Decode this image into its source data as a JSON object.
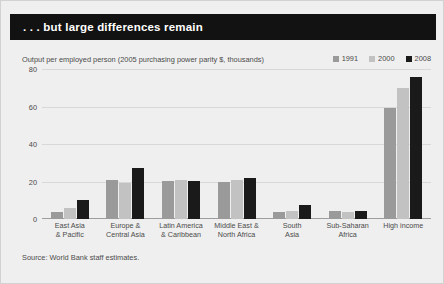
{
  "header": {
    "title": ". . . but large differences remain"
  },
  "subtitle": "Output per employed person (2005 purchasing power parity $, thousands)",
  "source": "Source: World Bank staff estimates.",
  "colors": {
    "series_1991": "#9a9a9a",
    "series_2000": "#c2c2c2",
    "series_2008": "#1a1a1a",
    "background": "#efefef",
    "header_band": "#121212",
    "gridline": "#d8d8d8",
    "axis": "#9d9d9d",
    "text": "#4b4b4b"
  },
  "chart_data": {
    "type": "bar",
    "title": ". . . but large differences remain",
    "subtitle": "Output per employed person (2005 purchasing power parity $, thousands)",
    "xlabel": "",
    "ylabel": "",
    "ylim": [
      0,
      80
    ],
    "yticks": [
      0,
      20,
      40,
      60,
      80
    ],
    "grid": true,
    "legend_position": "top-right",
    "categories": [
      "East Asia\n& Pacific",
      "Europe &\nCentral Asia",
      "Latin America\n& Caribbean",
      "Middle East &\nNorth Africa",
      "South\nAsia",
      "Sub-Saharan\nAfrica",
      "High income"
    ],
    "category_lines": [
      [
        "East Asia",
        "& Pacific"
      ],
      [
        "Europe &",
        "Central Asia"
      ],
      [
        "Latin America",
        "& Caribbean"
      ],
      [
        "Middle East &",
        "North Africa"
      ],
      [
        "South",
        "Asia"
      ],
      [
        "Sub-Saharan",
        "Africa"
      ],
      [
        "High income",
        ""
      ]
    ],
    "series": [
      {
        "name": "1991",
        "color": "#9a9a9a",
        "values": [
          4,
          21,
          20.5,
          20,
          3.5,
          4.5,
          59
        ]
      },
      {
        "name": "2000",
        "color": "#c2c2c2",
        "values": [
          6,
          19,
          21,
          21,
          4.5,
          4,
          70
        ]
      },
      {
        "name": "2008",
        "color": "#1a1a1a",
        "values": [
          10,
          27,
          20.5,
          22,
          7.5,
          4.5,
          76
        ]
      }
    ]
  }
}
